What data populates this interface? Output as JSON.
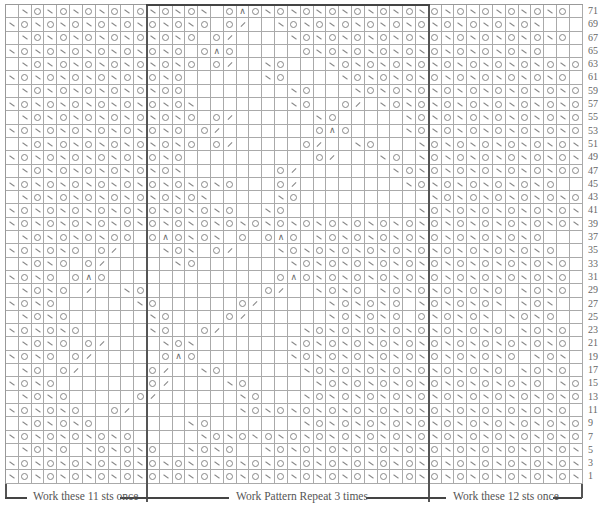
{
  "chart": {
    "columns": 45,
    "rows_shown": 36,
    "row_numbers": [
      "71",
      "69",
      "67",
      "65",
      "63",
      "61",
      "59",
      "57",
      "55",
      "53",
      "51",
      "49",
      "47",
      "45",
      "43",
      "41",
      "39",
      "37",
      "35",
      "33",
      "31",
      "29",
      "27",
      "25",
      "23",
      "21",
      "19",
      "17",
      "15",
      "13",
      "11",
      "9",
      "7",
      "5",
      "3",
      "1"
    ],
    "legend_encoding": {
      ".": "knit",
      "s": "ssk (left slant)",
      "k": "k2tog (right slant)",
      "o": "yarn over",
      "a": "double decrease"
    },
    "rows": [
      ".sososososososos.oaososososososososososososo",
      "sosososososososo.ok..sosososososososososos.",
      ".sososososososo.ok....sososososososososososo",
      "sososososososo.oao.....osososososososososo.",
      ".sososososososo.ok..so...sosososososososososo",
      "sososososososo......so....sososososososososo.",
      ".sosososososoo........so...sososososososososo",
      "sososososososos.......so..ok.sosososososososo.",
      ".sososososososo.ok......so.....sososososososo",
      "sososososososo.ok.......oao....sososososososo.",
      ".sososososososo.ok.....ok..so...sososososososo",
      "sosososososoSo..........ok...so.sososososososo.",
      ".sosososososos.......ok.......sososososososoo",
      "sososososososoSoso...ok........sosososososo.",
      ".sososososososos.....so..........sosososososo",
      "sososososososososo..so..........sososososososo.",
      "sososososososososososososososososososososososo",
      ".sosososoo.oaosos.o.oao.sososososososososo",
      "sososo.ok...sos.ok...sososososososososososo.",
      ".soso.ok.....so.......sososososososososososo",
      "soso.oao.............oaososososososososososo.",
      ".soso.k..so.........ok..soso.sososososo.soso",
      "soso......so......ok.....sososo.sososos.sos.",
      ".soso......so....ok......sososo.ososos.soso",
      "sososo.....so..ok......sosososososososo.soso.",
      ".soso.ok....sos.......sososososososososososo",
      "soso.ok.....oao.......sososososososososo.sos.",
      ".so.ok.....ok..so......sosososososososo.soso",
      "soso.......ok....so.....sososososososososo.sos.",
      ".soso.....ok......so...sososososososososososo",
      "sososo..ok........sososososososososososososo.",
      ".sososo.......so.......sososososososososososo",
      "sososososo.....sososososososososososososososo.",
      ".soso.sososo..soso..sososososososososososososo",
      "sososososososososososososososososososososososo",
      "sososososososososososososososososososososososo"
    ]
  },
  "brackets": {
    "left_label": "Work these 11 sts once",
    "middle_label": "Work Pattern Repeat 3 times",
    "right_label": "Work these 12 sts once"
  }
}
